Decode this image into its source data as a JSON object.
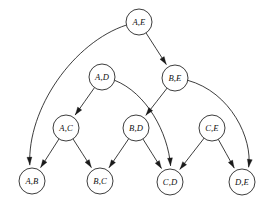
{
  "diagram": {
    "type": "directed-acyclic-graph",
    "title": "",
    "background_color": "#ffffff",
    "stroke_color": "#1a1a1a",
    "node_fill_color": "#ffffff",
    "node_radius": 13,
    "canvas": {
      "width": 277,
      "height": 206
    },
    "nodes": [
      {
        "id": "AE",
        "label": "A,E",
        "x": 139,
        "y": 22
      },
      {
        "id": "AD",
        "label": "A,D",
        "x": 102,
        "y": 77
      },
      {
        "id": "BE",
        "label": "B,E",
        "x": 175,
        "y": 78
      },
      {
        "id": "AC",
        "label": "A,C",
        "x": 66,
        "y": 128
      },
      {
        "id": "BD",
        "label": "B,D",
        "x": 136,
        "y": 128
      },
      {
        "id": "CE",
        "label": "C,E",
        "x": 212,
        "y": 128
      },
      {
        "id": "AB",
        "label": "A,B",
        "x": 32,
        "y": 181
      },
      {
        "id": "BC",
        "label": "B,C",
        "x": 100,
        "y": 181
      },
      {
        "id": "CD",
        "label": "C,D",
        "x": 170,
        "y": 182
      },
      {
        "id": "DE",
        "label": "D,E",
        "x": 242,
        "y": 182
      }
    ],
    "edges": [
      {
        "id": "e1",
        "from": "AE",
        "to": "BE",
        "directed": true,
        "curve": "straight"
      },
      {
        "id": "e2",
        "from": "AE",
        "to": "AB",
        "directed": true,
        "curve": "long-left-arc"
      },
      {
        "id": "e3",
        "from": "AD",
        "to": "AC",
        "directed": true,
        "curve": "straight"
      },
      {
        "id": "e4",
        "from": "AD",
        "to": "CD",
        "directed": true,
        "curve": "right-arc"
      },
      {
        "id": "e5",
        "from": "BE",
        "to": "BD",
        "directed": true,
        "curve": "straight"
      },
      {
        "id": "e6",
        "from": "BE",
        "to": "DE",
        "directed": true,
        "curve": "long-right-arc"
      },
      {
        "id": "e7",
        "from": "AC",
        "to": "AB",
        "directed": true,
        "curve": "straight"
      },
      {
        "id": "e8",
        "from": "AC",
        "to": "BC",
        "directed": true,
        "curve": "straight"
      },
      {
        "id": "e9",
        "from": "BD",
        "to": "BC",
        "directed": true,
        "curve": "straight"
      },
      {
        "id": "e10",
        "from": "BD",
        "to": "CD",
        "directed": true,
        "curve": "straight"
      },
      {
        "id": "e11",
        "from": "CE",
        "to": "CD",
        "directed": true,
        "curve": "straight"
      },
      {
        "id": "e12",
        "from": "CE",
        "to": "DE",
        "directed": true,
        "curve": "straight"
      }
    ]
  }
}
